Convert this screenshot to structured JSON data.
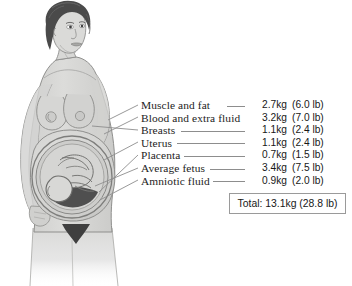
{
  "figure": {
    "alt_name": "pregnant-woman-anatomy-illustration",
    "colors": {
      "skin": "#d9d9d7",
      "skin_shadow": "#c3c3c1",
      "outline": "#8f8f8d",
      "hair": "#4a4a4a",
      "hair_highlight": "#6a6a6a",
      "uterus": "#c9c9c7",
      "placenta": "#4f4f4f",
      "fetus": "#d2d2d0",
      "leader_line": "#8d8d8d"
    }
  },
  "legend": {
    "rows": [
      {
        "label": "Muscle and fat",
        "kg": "2.7kg",
        "lb": "(6.0 lb)"
      },
      {
        "label": "Blood and extra fluid",
        "kg": "3.2kg",
        "lb": "(7.0 lb)"
      },
      {
        "label": "Breasts",
        "kg": "1.1kg",
        "lb": "(2.4 lb)"
      },
      {
        "label": "Uterus",
        "kg": "1.1kg",
        "lb": "(2.4 lb)"
      },
      {
        "label": "Placenta",
        "kg": "0.7kg",
        "lb": "(1.5 lb)"
      },
      {
        "label": "Average fetus",
        "kg": "3.4kg",
        "lb": "(7.5 lb)"
      },
      {
        "label": "Amniotic fluid",
        "kg": "0.9kg",
        "lb": "(2.0 lb)"
      }
    ],
    "total": "Total: 13.1kg  (28.8 lb)"
  }
}
